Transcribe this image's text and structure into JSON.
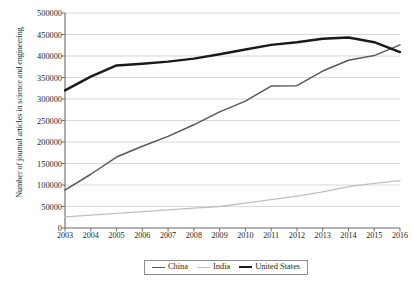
{
  "chart_data": {
    "type": "line",
    "title": "",
    "xlabel": "",
    "ylabel": "Number of journal articles in science and engineering",
    "x": [
      2003,
      2004,
      2005,
      2006,
      2007,
      2008,
      2009,
      2010,
      2011,
      2012,
      2013,
      2014,
      2015,
      2016
    ],
    "categories": [
      "2003",
      "2004",
      "2005",
      "2006",
      "2007",
      "2008",
      "2009",
      "2010",
      "2011",
      "2012",
      "2013",
      "2014",
      "2015",
      "2016"
    ],
    "ylim": [
      0,
      500000
    ],
    "xlim": [
      2003,
      2016
    ],
    "yticks": [
      0,
      50000,
      100000,
      150000,
      200000,
      250000,
      300000,
      350000,
      400000,
      450000,
      500000
    ],
    "ytick_labels": [
      "0",
      "50000",
      "100000",
      "150000",
      "200000",
      "250000",
      "300000",
      "350000",
      "400000",
      "450000",
      "500000"
    ],
    "grid": true,
    "grid_axis": "y",
    "legend_position": "bottom-center",
    "series": [
      {
        "name": "China",
        "color": "#595959",
        "width": 1.5,
        "values": [
          88000,
          125000,
          165000,
          190000,
          213000,
          240000,
          270000,
          295000,
          330000,
          331000,
          365000,
          390000,
          401000,
          426000
        ]
      },
      {
        "name": "India",
        "color": "#bfbfbf",
        "width": 1.3,
        "values": [
          26000,
          30000,
          34000,
          38000,
          42000,
          46000,
          50000,
          58000,
          66000,
          74000,
          84000,
          96000,
          104000,
          110000
        ]
      },
      {
        "name": "United States",
        "color": "#1a1a1a",
        "width": 2.4,
        "values": [
          320000,
          352000,
          378000,
          382000,
          387000,
          394000,
          404000,
          415000,
          426000,
          432000,
          440000,
          443000,
          432000,
          409000
        ]
      }
    ]
  },
  "legend": {
    "items": [
      {
        "label": "China"
      },
      {
        "label": "India"
      },
      {
        "label": "United States"
      }
    ]
  }
}
